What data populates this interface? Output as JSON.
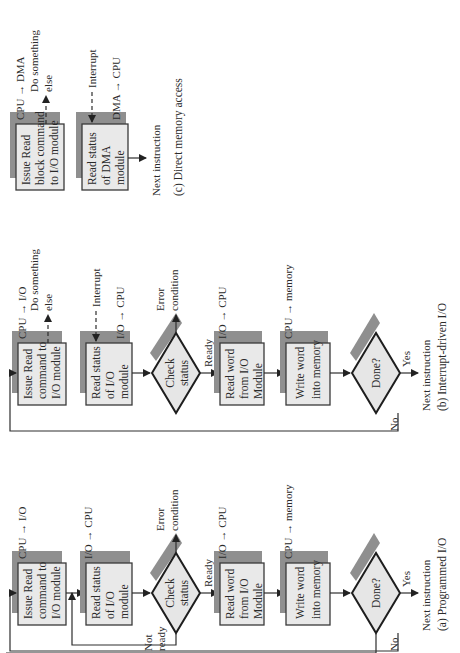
{
  "figure": {
    "panels": [
      {
        "id": "a",
        "caption": "(a) Programmed I/O",
        "steps": [
          {
            "lines": [
              "Issue Read",
              "command to",
              "I/O module"
            ],
            "annotation": "CPU → I/O"
          },
          {
            "lines": [
              "Read status",
              "of I/O",
              "module"
            ],
            "annotation": "I/O → CPU"
          },
          {
            "lines": [
              "Check",
              "status"
            ],
            "type": "decision",
            "error": [
              "Error",
              "condition"
            ],
            "ready": "Ready",
            "not_ready": [
              "Not",
              "ready"
            ]
          },
          {
            "lines": [
              "Read word",
              "from I/O",
              "Module"
            ],
            "annotation": "I/O → CPU"
          },
          {
            "lines": [
              "Write word",
              "into memory"
            ],
            "annotation": "CPU → memory"
          },
          {
            "lines": [
              "Done?"
            ],
            "type": "decision",
            "yes": "Yes",
            "no": "No"
          }
        ],
        "next": "Next instruction"
      },
      {
        "id": "b",
        "caption": "(b) Interrupt-driven I/O",
        "steps": [
          {
            "lines": [
              "Issue Read",
              "command to",
              "I/O module"
            ],
            "annotation": "CPU → I/O",
            "side": [
              "Do something",
              "else"
            ]
          },
          {
            "lines": [
              "Read status",
              "of I/O",
              "module"
            ],
            "annotation": "I/O → CPU",
            "interrupt": "Interrupt"
          },
          {
            "lines": [
              "Check",
              "status"
            ],
            "type": "decision",
            "error": [
              "Error",
              "condition"
            ],
            "ready": "Ready"
          },
          {
            "lines": [
              "Read word",
              "from I/O",
              "Module"
            ],
            "annotation": "I/O → CPU"
          },
          {
            "lines": [
              "Write word",
              "into memory"
            ],
            "annotation": "CPU → memory"
          },
          {
            "lines": [
              "Done?"
            ],
            "type": "decision",
            "yes": "Yes",
            "no": "No"
          }
        ],
        "next": "Next instruction"
      },
      {
        "id": "c",
        "caption": "(c) Direct memory access",
        "steps": [
          {
            "lines": [
              "Issue Read",
              "block command",
              "to I/O module"
            ],
            "annotation": "CPU → DMA",
            "side": [
              "Do something",
              "else"
            ]
          },
          {
            "lines": [
              "Read status",
              "of DMA",
              "module"
            ],
            "annotation": "DMA → CPU",
            "interrupt": "Interrupt"
          }
        ],
        "next": "Next instruction"
      }
    ]
  }
}
